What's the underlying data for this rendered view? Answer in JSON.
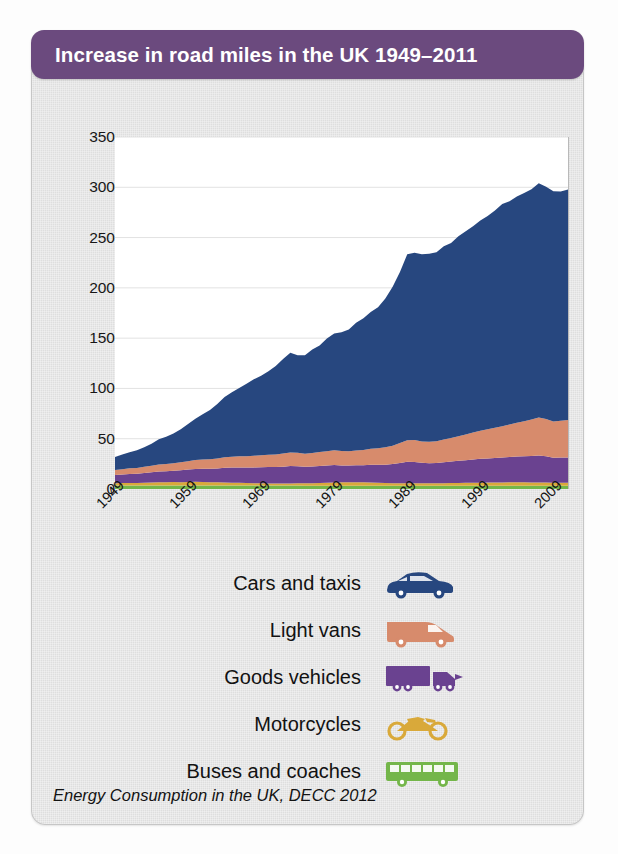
{
  "banner": {
    "title": "Increase in road miles in the UK 1949–2011"
  },
  "source": {
    "text": "Energy Consumption in the UK, DECC 2012"
  },
  "axis": {
    "ylabel": "Billion vehicle miles",
    "yticks": [
      "0",
      "50",
      "100",
      "150",
      "200",
      "250",
      "300",
      "350"
    ],
    "xticks": [
      "1949",
      "1959",
      "1969",
      "1979",
      "1989",
      "1999",
      "2009"
    ]
  },
  "legend": {
    "items": [
      {
        "label": "Cars and taxis",
        "icon": "car-icon",
        "color": "#27477f"
      },
      {
        "label": "Light vans",
        "icon": "van-icon",
        "color": "#d78b6c"
      },
      {
        "label": "Goods vehicles",
        "icon": "truck-icon",
        "color": "#6a4290"
      },
      {
        "label": "Motorcycles",
        "icon": "motorcycle-icon",
        "color": "#d9a93a"
      },
      {
        "label": "Buses and coaches",
        "icon": "bus-icon",
        "color": "#74b64a"
      }
    ]
  },
  "chart_data": {
    "type": "area",
    "stacked": true,
    "title": "Increase in road miles in the UK 1949–2011",
    "xlabel": "",
    "ylabel": "Billion vehicle miles",
    "ylim": [
      0,
      350
    ],
    "xlim": [
      1949,
      2011
    ],
    "grid": "horizontal",
    "legend_position": "below",
    "x": [
      1949,
      1950,
      1951,
      1952,
      1953,
      1954,
      1955,
      1956,
      1957,
      1958,
      1959,
      1960,
      1961,
      1962,
      1963,
      1964,
      1965,
      1966,
      1967,
      1968,
      1969,
      1970,
      1971,
      1972,
      1973,
      1974,
      1975,
      1976,
      1977,
      1978,
      1979,
      1980,
      1981,
      1982,
      1983,
      1984,
      1985,
      1986,
      1987,
      1988,
      1989,
      1990,
      1991,
      1992,
      1993,
      1994,
      1995,
      1996,
      1997,
      1998,
      1999,
      2000,
      2001,
      2002,
      2003,
      2004,
      2005,
      2006,
      2007,
      2008,
      2009,
      2010,
      2011
    ],
    "series": [
      {
        "name": "Buses and coaches",
        "color": "#74b64a",
        "values": [
          3.5,
          3.5,
          3.5,
          3.4,
          3.4,
          3.4,
          3.4,
          3.4,
          3.4,
          3.4,
          3.4,
          3.4,
          3.4,
          3.4,
          3.4,
          3.4,
          3.4,
          3.4,
          3.4,
          3.4,
          3.4,
          3.4,
          3.4,
          3.4,
          3.4,
          3.4,
          3.3,
          3.3,
          3.3,
          3.3,
          3.3,
          3.3,
          3.3,
          3.3,
          3.3,
          3.3,
          3.3,
          3.3,
          3.3,
          3.3,
          3.3,
          3.3,
          3.3,
          3.3,
          3.3,
          3.3,
          3.3,
          3.3,
          3.3,
          3.3,
          3.3,
          3.3,
          3.3,
          3.3,
          3.3,
          3.3,
          3.3,
          3.3,
          3.3,
          3.3,
          3.2,
          3.2,
          3.2
        ]
      },
      {
        "name": "Motorcycles",
        "color": "#d9a93a",
        "values": [
          2.3,
          2.4,
          2.5,
          2.6,
          2.8,
          3.0,
          3.2,
          3.3,
          3.5,
          3.4,
          3.6,
          3.7,
          3.6,
          3.4,
          3.2,
          3.1,
          2.9,
          2.7,
          2.5,
          2.3,
          2.2,
          2.1,
          2.0,
          2.0,
          2.1,
          2.3,
          2.4,
          2.5,
          2.7,
          2.9,
          3.1,
          3.3,
          3.5,
          3.5,
          3.3,
          3.1,
          2.9,
          2.7,
          2.5,
          2.4,
          2.4,
          2.4,
          2.4,
          2.4,
          2.4,
          2.5,
          2.6,
          2.7,
          2.8,
          2.9,
          3.0,
          3.1,
          3.1,
          3.2,
          3.3,
          3.3,
          3.3,
          3.2,
          3.2,
          3.1,
          3.0,
          3.0,
          3.0
        ]
      },
      {
        "name": "Goods vehicles",
        "color": "#6a4290",
        "values": [
          8.0,
          8.5,
          9.0,
          9.2,
          9.7,
          10.2,
          10.8,
          11.0,
          11.3,
          11.8,
          12.3,
          12.9,
          13.2,
          13.4,
          13.9,
          14.6,
          15.0,
          15.3,
          15.4,
          15.8,
          16.1,
          16.3,
          16.4,
          16.8,
          17.3,
          16.9,
          16.3,
          16.6,
          16.9,
          17.2,
          17.5,
          16.8,
          16.5,
          16.9,
          17.0,
          17.6,
          17.9,
          18.2,
          19.0,
          20.1,
          21.3,
          21.2,
          20.3,
          20.0,
          20.2,
          20.9,
          21.4,
          22.0,
          22.6,
          23.2,
          23.7,
          24.0,
          24.4,
          24.8,
          25.2,
          25.6,
          25.9,
          26.3,
          26.8,
          26.2,
          24.8,
          25.0,
          25.2
        ]
      },
      {
        "name": "Light vans",
        "color": "#d78b6c",
        "values": [
          5.0,
          5.3,
          5.6,
          5.8,
          6.1,
          6.5,
          7.0,
          7.2,
          7.5,
          7.9,
          8.4,
          8.9,
          9.2,
          9.4,
          9.9,
          10.4,
          10.8,
          11.1,
          11.3,
          11.6,
          11.9,
          12.2,
          12.5,
          13.0,
          13.6,
          13.4,
          13.1,
          13.4,
          13.8,
          14.2,
          14.7,
          14.4,
          14.3,
          14.7,
          15.2,
          15.9,
          16.5,
          17.2,
          18.3,
          19.9,
          21.4,
          21.9,
          21.3,
          21.2,
          21.6,
          22.6,
          23.4,
          24.4,
          25.5,
          26.8,
          28.0,
          29.0,
          30.0,
          31.2,
          32.4,
          33.6,
          34.8,
          36.2,
          37.8,
          37.0,
          36.0,
          36.6,
          37.3
        ]
      },
      {
        "name": "Cars and taxis",
        "color": "#27477f",
        "values": [
          13.0,
          14.5,
          16.0,
          17.5,
          19.5,
          22.0,
          25.0,
          27.0,
          29.5,
          33.0,
          37.0,
          41.0,
          45.0,
          49.0,
          54.0,
          60.0,
          64.0,
          68.0,
          72.0,
          76.0,
          79.0,
          83.0,
          88.0,
          94.0,
          99.0,
          97.0,
          98.0,
          103.0,
          106.0,
          112.0,
          116.0,
          118.0,
          121.0,
          127.0,
          131.0,
          136.0,
          140.0,
          148.0,
          158.0,
          170.0,
          185.0,
          186.0,
          186.0,
          187.0,
          188.0,
          192.0,
          194.0,
          199.0,
          202.0,
          205.0,
          209.0,
          212.0,
          216.0,
          221.0,
          222.0,
          225.0,
          227.0,
          229.0,
          233.0,
          231.0,
          229.0,
          228.0,
          229.0
        ]
      }
    ],
    "totals_note": "Total road traffic rises from about 32 billion vehicle miles in 1949 to a peak near 315 in 2007, easing to about 305 by 2011."
  }
}
